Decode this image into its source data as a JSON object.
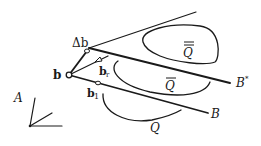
{
  "diagram": {
    "labels": {
      "delta_b": "Δb",
      "b": "b",
      "b_r": "b",
      "b_r_sub": "r",
      "b_1": "b",
      "b_1_sub": "1",
      "B_star": "B",
      "B_star_sup": "*",
      "B": "B",
      "Q_double_bar": "Q",
      "Q_bar": "Q",
      "Q": "Q",
      "A": "A"
    },
    "colors": {
      "ink": "#1a1a1a",
      "background": "#ffffff"
    }
  }
}
